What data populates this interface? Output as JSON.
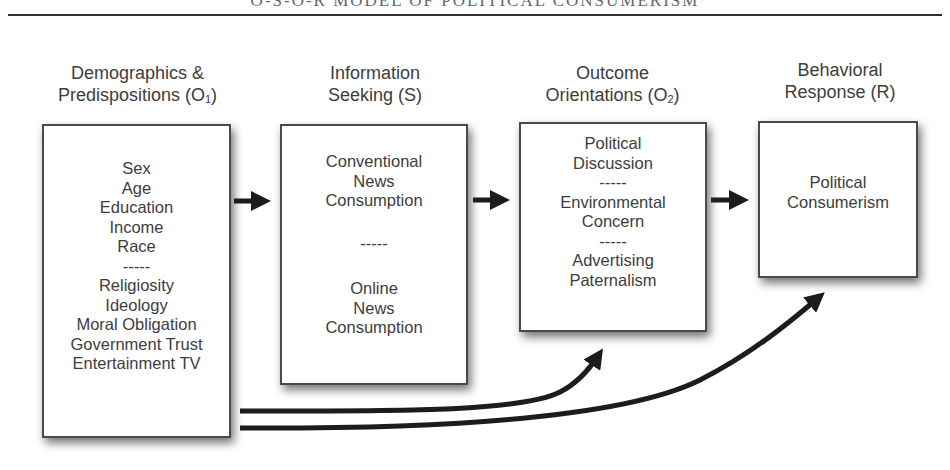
{
  "figure": {
    "title": "O-S-O-R MODEL OF POLITICAL CONSUMERISM"
  },
  "stages": [
    {
      "id": "o1",
      "header_line1": "Demographics &",
      "header_line2": "Predispositions (O",
      "header_sub": "1",
      "header_close": ")",
      "items": [
        "Sex",
        "Age",
        "Education",
        "Income",
        "Race",
        "-----",
        "Religiosity",
        "Ideology",
        "Moral Obligation",
        "Government Trust",
        "Entertainment TV"
      ]
    },
    {
      "id": "s",
      "header_line1": "Information",
      "header_line2": "Seeking (S)",
      "items": [
        "Conventional",
        "News",
        "Consumption",
        "-----",
        "Online",
        "News",
        "Consumption"
      ]
    },
    {
      "id": "o2",
      "header_line1": "Outcome",
      "header_line2": "Orientations (O",
      "header_sub": "2",
      "header_close": ")",
      "items": [
        "Political",
        "Discussion",
        "-----",
        "Environmental",
        "Concern",
        "-----",
        "Advertising",
        "Paternalism"
      ]
    },
    {
      "id": "r",
      "header_line1": "Behavioral",
      "header_line2": "Response (R)",
      "items": [
        "Political",
        "Consumerism"
      ]
    }
  ],
  "connections": [
    {
      "from": "o1",
      "to": "s",
      "style": "straight-arrow"
    },
    {
      "from": "s",
      "to": "o2",
      "style": "straight-arrow"
    },
    {
      "from": "o2",
      "to": "r",
      "style": "straight-arrow"
    },
    {
      "from": "o1",
      "to": "o2",
      "style": "curved-arrow"
    },
    {
      "from": "o1",
      "to": "r",
      "style": "curved-arrow"
    }
  ],
  "colors": {
    "text": "#3d3d3d",
    "box_border": "#4a4a4a",
    "arrow": "#1a1a1a"
  }
}
